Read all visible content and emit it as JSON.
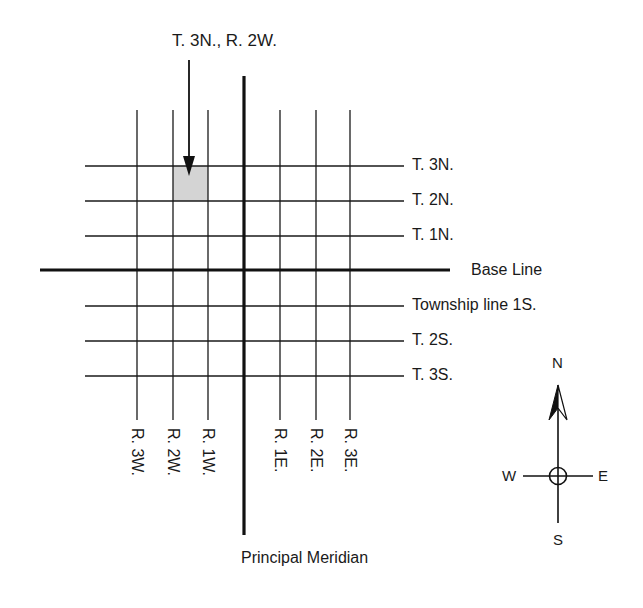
{
  "callout": {
    "label": "T. 3N., R. 2W.",
    "highlighted_cell": {
      "township": "T. 3N.",
      "range": "R. 2W."
    },
    "highlight_color": "#d4d4d4"
  },
  "township_lines": [
    {
      "label": "T. 3N.",
      "y": 166
    },
    {
      "label": "T. 2N.",
      "y": 201
    },
    {
      "label": "T. 1N.",
      "y": 236
    },
    {
      "label": "Base Line",
      "y": 270,
      "principal": true
    },
    {
      "label": "Township line 1S.",
      "y": 306
    },
    {
      "label": "T. 2S.",
      "y": 341
    },
    {
      "label": "T. 3S.",
      "y": 376
    }
  ],
  "range_lines": [
    {
      "label": "R. 3W.",
      "x": 137
    },
    {
      "label": "R. 2W.",
      "x": 173
    },
    {
      "label": "R. 1W.",
      "x": 208
    },
    {
      "label": "Principal Meridian",
      "x": 244,
      "principal": true
    },
    {
      "label": "R. 1E.",
      "x": 280
    },
    {
      "label": "R. 2E.",
      "x": 316
    },
    {
      "label": "R. 3E.",
      "x": 350
    }
  ],
  "principal_meridian_label": "Principal Meridian",
  "base_line_label": "Base Line",
  "compass": {
    "n": "N",
    "s": "S",
    "e": "E",
    "w": "W"
  },
  "colors": {
    "line": "#1a1a1a",
    "background": "#ffffff",
    "highlight": "#d4d4d4"
  }
}
